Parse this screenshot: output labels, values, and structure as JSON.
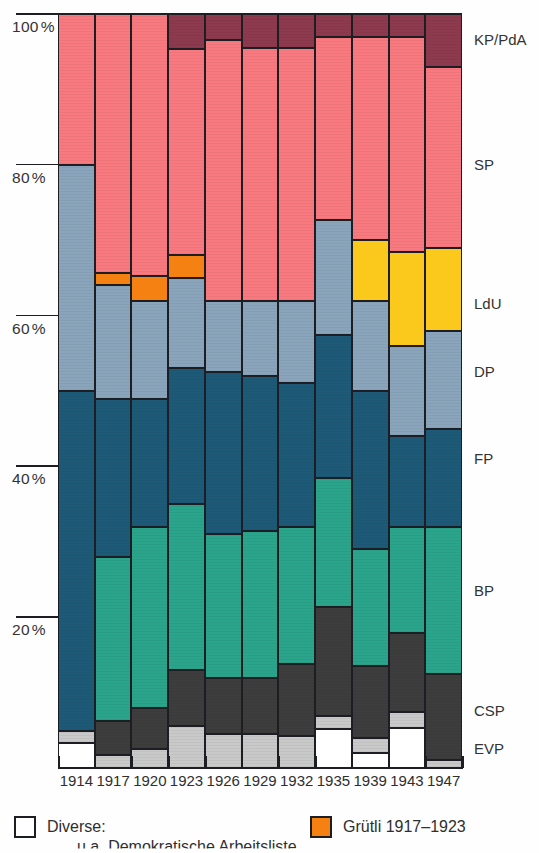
{
  "chart_data": {
    "type": "bar",
    "subtype": "stacked-percentage-column",
    "title": "",
    "xlabel": "",
    "ylabel": "",
    "ylim": [
      0,
      100
    ],
    "grid": false,
    "legend_position": "right-labels",
    "categories": [
      "1914",
      "1917",
      "1920",
      "1923",
      "1926",
      "1929",
      "1932",
      "1935",
      "1939",
      "1943",
      "1947"
    ],
    "series": [
      {
        "name": "Diverse",
        "key": "diverse",
        "color": "#ffffff",
        "values": [
          3.3,
          0.0,
          0.0,
          0.0,
          0.0,
          0.0,
          0.0,
          5.2,
          2.0,
          5.3,
          0.0
        ]
      },
      {
        "name": "EVP",
        "key": "evp",
        "color": "#c9c9c9",
        "values": [
          1.6,
          1.7,
          2.5,
          5.6,
          4.5,
          4.5,
          4.3,
          1.7,
          2.0,
          2.1,
          1.0
        ]
      },
      {
        "name": "CSP",
        "key": "csp",
        "color": "#3d3d3d",
        "values": [
          0.0,
          4.5,
          5.4,
          7.4,
          7.5,
          7.5,
          9.5,
          14.5,
          9.5,
          10.5,
          11.5
        ]
      },
      {
        "name": "BP",
        "key": "bp",
        "color": "#2aa58c",
        "values": [
          0.0,
          21.8,
          24.1,
          22.0,
          19.0,
          19.5,
          18.2,
          17.0,
          15.5,
          14.1,
          19.5
        ]
      },
      {
        "name": "FP",
        "key": "fp",
        "color": "#1d5a78",
        "values": [
          45.1,
          21.0,
          17.0,
          18.0,
          21.5,
          20.5,
          19.0,
          19.0,
          21.0,
          12.0,
          13.0
        ]
      },
      {
        "name": "DP",
        "key": "dp",
        "color": "#8aa5bb",
        "values": [
          30.0,
          15.0,
          13.0,
          12.0,
          9.5,
          10.0,
          11.0,
          15.3,
          12.0,
          12.0,
          13.0
        ]
      },
      {
        "name": "LdU",
        "key": "ldu",
        "color": "#fbc91c",
        "values": [
          0.0,
          0.0,
          0.0,
          0.0,
          0.0,
          0.0,
          0.0,
          0.0,
          8.0,
          12.5,
          11.0
        ]
      },
      {
        "name": "Grütli",
        "key": "grutli",
        "color": "#f58113",
        "values": [
          0.0,
          1.6,
          3.2,
          3.0,
          0.0,
          0.0,
          0.0,
          0.0,
          0.0,
          0.0,
          0.0
        ]
      },
      {
        "name": "SP",
        "key": "sp",
        "color": "#f87a80",
        "values": [
          20.0,
          34.4,
          34.8,
          27.4,
          34.5,
          33.5,
          33.5,
          24.3,
          27.0,
          28.5,
          24.0
        ]
      },
      {
        "name": "KP/PdA",
        "key": "kp",
        "color": "#8e3a4e",
        "values": [
          0.0,
          0.0,
          0.0,
          4.6,
          3.5,
          4.5,
          4.5,
          3.0,
          3.0,
          3.0,
          7.0
        ]
      }
    ],
    "y_ticks": [
      {
        "value": 100,
        "label": "100",
        "unit": "%"
      },
      {
        "value": 80,
        "label": "80",
        "unit": "%"
      },
      {
        "value": 60,
        "label": "60",
        "unit": "%"
      },
      {
        "value": 40,
        "label": "40",
        "unit": "%"
      },
      {
        "value": 20,
        "label": "20",
        "unit": "%"
      }
    ],
    "right_labels": [
      {
        "text": "KP/PdA",
        "y_pct": 96.5
      },
      {
        "text": "SP",
        "y_pct": 80.0
      },
      {
        "text": "LdU",
        "y_pct": 61.5
      },
      {
        "text": "DP",
        "y_pct": 52.5
      },
      {
        "text": "FP",
        "y_pct": 41.0
      },
      {
        "text": "BP",
        "y_pct": 23.5
      },
      {
        "text": "CSP",
        "y_pct": 7.5
      },
      {
        "text": "EVP",
        "y_pct": 2.5
      }
    ]
  },
  "legend": {
    "items": [
      {
        "label": "Diverse:",
        "color": "#ffffff",
        "name": "diverse"
      },
      {
        "label": "Grütli 1917–1923",
        "color": "#f58113",
        "name": "grutli"
      }
    ],
    "sub_note": "u.a. Demokratische Arbeitsliste"
  }
}
